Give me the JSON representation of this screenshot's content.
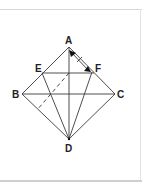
{
  "diagram": {
    "type": "geometry",
    "points": {
      "A": {
        "label": "A",
        "x": 69,
        "y": 47
      },
      "B": {
        "label": "B",
        "x": 22,
        "y": 94
      },
      "C": {
        "label": "C",
        "x": 115,
        "y": 94
      },
      "D": {
        "label": "D",
        "x": 69,
        "y": 139
      },
      "E": {
        "label": "E",
        "x": 42,
        "y": 73
      },
      "F": {
        "label": "F",
        "x": 91,
        "y": 72
      }
    },
    "segments": [
      "AB",
      "BD",
      "DC",
      "CA",
      "BC",
      "AD",
      "EF",
      "ED",
      "FD"
    ],
    "dashed_segments": [
      "fold line parallel to AB"
    ],
    "annotations": [
      "arrow from A toward F"
    ],
    "colors": {
      "stroke": "#333333",
      "label": "#222222",
      "frame": "#d8d8d8"
    }
  }
}
